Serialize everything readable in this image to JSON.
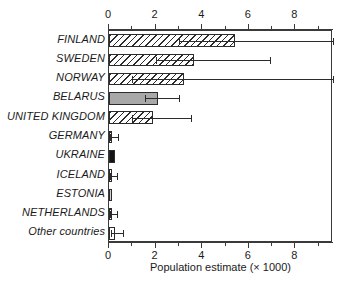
{
  "chart_data": {
    "type": "bar",
    "orientation": "horizontal",
    "title": "",
    "xlabel": "Population estimate (× 1000)",
    "ylabel": "",
    "xlim": [
      0,
      9.6
    ],
    "xticks": [
      0,
      2,
      4,
      6,
      8
    ],
    "xtick_labels": [
      "0",
      "2",
      "4",
      "6",
      "8"
    ],
    "minor_xticks": [
      1,
      3,
      5,
      7,
      9
    ],
    "grid": false,
    "legend": "none",
    "axis_top": true,
    "axis_bottom": true,
    "categories": [
      "FINLAND",
      "SWEDEN",
      "NORWAY",
      "BELARUS",
      "UNITED KINGDOM",
      "GERMANY",
      "UKRAINE",
      "ICELAND",
      "ESTONIA",
      "NETHERLANDS",
      "Other countries"
    ],
    "values": [
      5.4,
      3.65,
      3.2,
      2.1,
      1.9,
      0.15,
      0.25,
      0.1,
      0.12,
      0.1,
      0.25
    ],
    "error_low": [
      3.0,
      2.0,
      1.0,
      1.55,
      1.0,
      0.05,
      null,
      0.05,
      null,
      0.05,
      0.1
    ],
    "error_high": [
      9.6,
      6.9,
      9.6,
      3.0,
      3.5,
      0.4,
      null,
      0.35,
      null,
      0.35,
      0.6
    ],
    "fills": [
      "hatch",
      "hatch",
      "hatch",
      "solid-gray",
      "hatch",
      "hatch",
      "solid-black",
      "solid-white",
      "lightgray",
      "hatch",
      "solid-white"
    ]
  }
}
